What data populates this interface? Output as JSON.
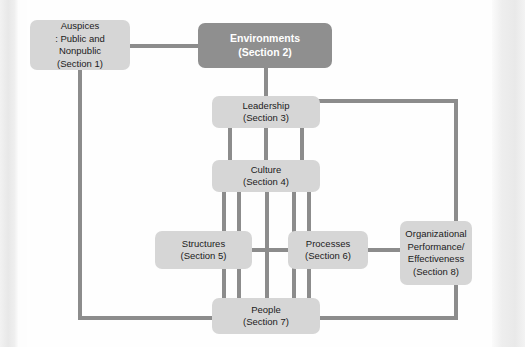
{
  "diagram": {
    "colors": {
      "box_fill": "#d6d6d6",
      "box_highlight_fill": "#8f8f8f",
      "box_highlight_text": "#ffffff",
      "connector": "#8c8c8c",
      "text": "#1b1b1b",
      "page_background": "#fefefe"
    },
    "nodes": [
      {
        "id": "auspices",
        "name": "auspices",
        "lines": [
          "Auspices",
          ": Public and Nonpublic",
          "(Section 1)"
        ],
        "section": "Section 1",
        "highlight": false
      },
      {
        "id": "environments",
        "name": "environments",
        "lines": [
          "Environments",
          "(Section 2)"
        ],
        "section": "Section 2",
        "highlight": true
      },
      {
        "id": "leadership",
        "name": "leadership",
        "lines": [
          "Leadership",
          "(Section 3)"
        ],
        "section": "Section 3",
        "highlight": false
      },
      {
        "id": "culture",
        "name": "culture",
        "lines": [
          "Culture",
          "(Section 4)"
        ],
        "section": "Section 4",
        "highlight": false
      },
      {
        "id": "structures",
        "name": "structures",
        "lines": [
          "Structures",
          "(Section 5)"
        ],
        "section": "Section 5",
        "highlight": false
      },
      {
        "id": "processes",
        "name": "processes",
        "lines": [
          "Processes",
          "(Section 6)"
        ],
        "section": "Section 6",
        "highlight": false
      },
      {
        "id": "people",
        "name": "people",
        "lines": [
          "People",
          "(Section 7)"
        ],
        "section": "Section 7",
        "highlight": false
      },
      {
        "id": "organizational_performance",
        "name": "organizational-performance-effectiveness",
        "lines": [
          "Organizational",
          "Performance/",
          "Effectiveness",
          "(Section 8)"
        ],
        "section": "Section 8",
        "highlight": false
      }
    ],
    "edges": [
      {
        "from": "auspices",
        "to": "environments",
        "style": "horizontal"
      },
      {
        "from": "auspices",
        "to": "people",
        "style": "orthogonal-left"
      },
      {
        "from": "environments",
        "to": "leadership",
        "style": "vertical"
      },
      {
        "from": "leadership",
        "to": "culture",
        "style": "vertical-triple"
      },
      {
        "from": "leadership",
        "to": "people",
        "style": "orthogonal-right"
      },
      {
        "from": "culture",
        "to": "structures",
        "style": "vertical"
      },
      {
        "from": "culture",
        "to": "processes",
        "style": "vertical"
      },
      {
        "from": "culture",
        "to": "people",
        "style": "vertical"
      },
      {
        "from": "structures",
        "to": "processes",
        "style": "horizontal"
      },
      {
        "from": "structures",
        "to": "people",
        "style": "vertical"
      },
      {
        "from": "processes",
        "to": "people",
        "style": "vertical"
      },
      {
        "from": "processes",
        "to": "organizational_performance",
        "style": "horizontal"
      }
    ]
  }
}
